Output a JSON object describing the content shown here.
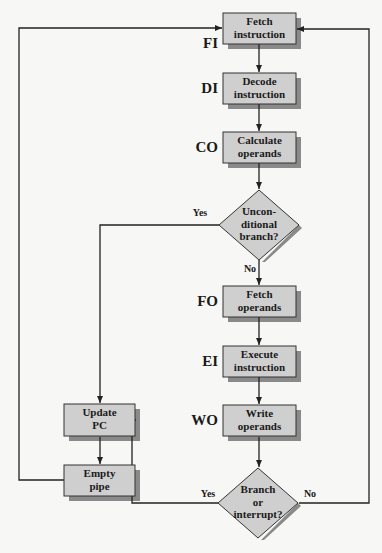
{
  "colors": {
    "box_fill": "#cfcfcf",
    "box_stroke": "#333333",
    "shadow": "#8a8a8a",
    "line": "#222222",
    "background": "#f7f7f5"
  },
  "nodes": {
    "fetch_instruction": {
      "label": "Fetch\ninstruction",
      "stage": "FI"
    },
    "decode_instruction": {
      "label": "Decode\ninstruction",
      "stage": "DI"
    },
    "calculate_operands": {
      "label": "Calculate\noperands",
      "stage": "CO"
    },
    "unconditional_branch": {
      "label": "Uncon-\nditional\nbranch?"
    },
    "fetch_operands": {
      "label": "Fetch\noperands",
      "stage": "FO"
    },
    "execute_instruction": {
      "label": "Execute\ninstruction",
      "stage": "EI"
    },
    "write_operands": {
      "label": "Write\noperands",
      "stage": "WO"
    },
    "branch_or_interrupt": {
      "label": "Branch\nor\ninterrupt?"
    },
    "update_pc": {
      "label": "Update\nPC"
    },
    "empty_pipe": {
      "label": "Empty\npipe"
    }
  },
  "edges": {
    "uncond_yes": "Yes",
    "uncond_no": "No",
    "branch_yes": "Yes",
    "branch_no": "No"
  }
}
